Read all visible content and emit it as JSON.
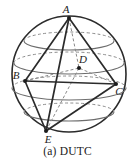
{
  "figure": {
    "caption": "(a) DUTC",
    "kind": "sphere-inscribed-polyhedron-diagram",
    "colors": {
      "background": "#ffffff",
      "sphere_outline": "#2b2b2b",
      "latitude_line": "#6d6d6d",
      "solid_edge": "#2b2b2b",
      "hidden_edge": "#8a8a8a",
      "vertex_dot": "#1c1c1c",
      "label_text": "#1c1c1c"
    },
    "sphere": {
      "center_x": 69,
      "center_y": 74,
      "radius_x": 57,
      "radius_y": 58
    },
    "latitudes": [
      {
        "name": "upper-latitude",
        "cy": 41,
        "rx": 45,
        "ry": 9
      },
      {
        "name": "upper-mid-latitude",
        "cy": 63,
        "rx": 55,
        "ry": 11
      },
      {
        "name": "equator",
        "cy": 88,
        "rx": 57,
        "ry": 12
      },
      {
        "name": "lower-latitude",
        "cy": 112,
        "rx": 45,
        "ry": 9
      }
    ],
    "vertices": [
      {
        "id": "A",
        "label": "A",
        "x": 69,
        "y": 18,
        "label_x": 66,
        "label_y": 13,
        "visible_dot": true
      },
      {
        "id": "B",
        "label": "B",
        "x": 25,
        "y": 81,
        "label_x": 14,
        "label_y": 76,
        "visible_dot": true
      },
      {
        "id": "C",
        "label": "C",
        "x": 116,
        "y": 84,
        "label_x": 117,
        "label_y": 95,
        "visible_dot": true
      },
      {
        "id": "D",
        "label": "D",
        "x": 79,
        "y": 68,
        "label_x": 80,
        "label_y": 62,
        "visible_dot": true
      },
      {
        "id": "E",
        "label": "E",
        "x": 46,
        "y": 131,
        "label_x": 46,
        "label_y": 143,
        "visible_dot": true
      }
    ],
    "solid_edges": [
      {
        "from": "A",
        "to": "B"
      },
      {
        "from": "A",
        "to": "C"
      },
      {
        "from": "A",
        "to": "E"
      },
      {
        "from": "B",
        "to": "C"
      },
      {
        "from": "B",
        "to": "E"
      },
      {
        "from": "C",
        "to": "E"
      }
    ],
    "hidden_edges": [
      {
        "from": "A",
        "to": "D"
      },
      {
        "from": "B",
        "to": "D"
      },
      {
        "from": "C",
        "to": "D"
      },
      {
        "from": "D",
        "to": "E"
      }
    ]
  }
}
